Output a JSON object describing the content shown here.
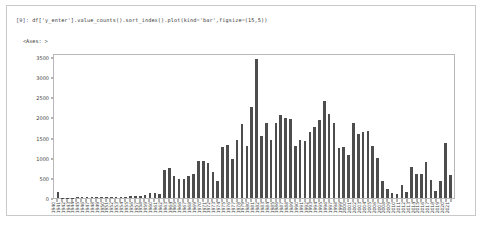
{
  "notebook": {
    "prompt": "[9]:",
    "code": "df['y_enter'].value_counts().sort_index().plot(kind='bar',figsize=(15,5))",
    "output_text": "<Axes: >"
  },
  "chart_data": {
    "type": "bar",
    "title": "",
    "xlabel": "",
    "ylabel": "",
    "ylim": [
      0,
      3600
    ],
    "yticks": [
      0,
      500,
      1000,
      1500,
      2000,
      2500,
      3000,
      3500
    ],
    "grid": false,
    "legend": false,
    "bar_color": "#4d4d4d",
    "categories": [
      "1940",
      "1941",
      "1942",
      "1943",
      "1944",
      "1945",
      "1946",
      "1947",
      "1948",
      "1949",
      "1950",
      "1951",
      "1952",
      "1953",
      "1954",
      "1955",
      "1956",
      "1957",
      "1958",
      "1959",
      "1960",
      "1961",
      "1962",
      "1963",
      "1964",
      "1965",
      "1966",
      "1967",
      "1968",
      "1969",
      "1970",
      "1971",
      "1972",
      "1973",
      "1974",
      "1975",
      "1976",
      "1977",
      "1978",
      "1979",
      "1980",
      "1981",
      "1982",
      "1983",
      "1984",
      "1985",
      "1986",
      "1987",
      "1988",
      "1989",
      "1990",
      "1991",
      "1992",
      "1993",
      "1994",
      "1995",
      "1996",
      "1997",
      "1998",
      "1999",
      "2000",
      "2001",
      "2002",
      "2003",
      "2004",
      "2005",
      "2006",
      "2007",
      "2008",
      "2009",
      "2010",
      "2011",
      "2012",
      "2013",
      "2014",
      "2015",
      "2016",
      "2017",
      "2018",
      "2019",
      "2020",
      "2021"
    ],
    "values": [
      155,
      10,
      8,
      12,
      14,
      20,
      26,
      30,
      22,
      28,
      34,
      30,
      36,
      32,
      26,
      40,
      46,
      60,
      72,
      120,
      130,
      104,
      700,
      760,
      560,
      480,
      470,
      560,
      610,
      920,
      930,
      870,
      660,
      430,
      1280,
      1340,
      980,
      1460,
      1870,
      1320,
      2300,
      3500,
      1560,
      1900,
      1470,
      1890,
      2080,
      2010,
      1990,
      1300,
      1460,
      1440,
      1660,
      1800,
      1960,
      2440,
      2120,
      1880,
      1260,
      1290,
      1090,
      1890,
      1620,
      1660,
      1680,
      1320,
      1000,
      420,
      230,
      120,
      110,
      320,
      160,
      770,
      600,
      600,
      900,
      460,
      180,
      420,
      1390,
      580
    ]
  }
}
